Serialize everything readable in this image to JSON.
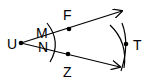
{
  "diagram": {
    "type": "geometric-construction",
    "vertex": "U",
    "ray_points": [
      "F",
      "Z"
    ],
    "arc_intersection_labels": [
      "M",
      "N"
    ],
    "bisector_point": "T",
    "labels": {
      "U": "U",
      "F": "F",
      "Z": "Z",
      "M": "M",
      "N": "N",
      "T": "T"
    },
    "color": "#000000"
  }
}
